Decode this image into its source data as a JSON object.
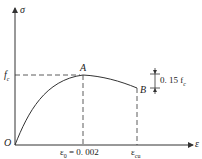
{
  "diagram": {
    "type": "stress-strain curve (concrete)",
    "axes": {
      "y_label": "σ",
      "x_label": "ε",
      "origin_label": "O"
    },
    "points": {
      "peak": {
        "label": "A",
        "stress": "f_c",
        "strain": "ε0 = 0.002"
      },
      "ultimate": {
        "label": "B",
        "strain": "εcu"
      }
    },
    "labels": {
      "fc": "f",
      "fc_sub": "c",
      "eps0": "ε",
      "eps0_sub": "0",
      "eps0_value": " = 0. 002",
      "epscu": "ε",
      "epscu_sub": "cu",
      "drop": "0. 15 f",
      "drop_sub": "c",
      "point_a": "A",
      "point_b": "B"
    },
    "colors": {
      "line": "#333333",
      "background": "#ffffff"
    }
  }
}
